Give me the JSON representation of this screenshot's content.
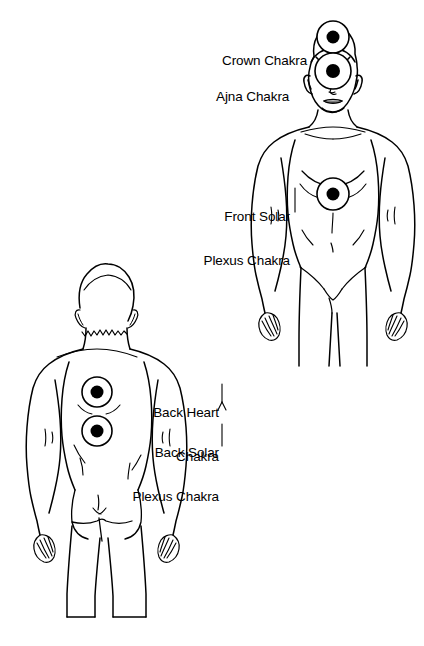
{
  "diagram": {
    "stroke_color": "#000000",
    "fill_color": "#ffffff",
    "chakra_dot_color": "#000000",
    "background_color": "#ffffff"
  },
  "labels": {
    "crown": {
      "lines": [
        "Crown Chakra"
      ],
      "text": "Crown Chakra"
    },
    "ajna": {
      "lines": [
        "Ajna Chakra"
      ],
      "text": "Ajna Chakra"
    },
    "front_solar_plexus": {
      "lines": [
        "Front Solar",
        "Plexus Chakra"
      ],
      "line1": "Front Solar",
      "line2": "Plexus Chakra"
    },
    "back_heart": {
      "lines": [
        "Back Heart",
        "Chakra"
      ],
      "line1": "Back Heart",
      "line2": "Chakra"
    },
    "back_solar_plexus": {
      "lines": [
        "Back Solar",
        "Plexus Chakra"
      ],
      "line1": "Back Solar",
      "line2": "Plexus Chakra"
    }
  },
  "figures": {
    "front": {
      "name": "front-view-body",
      "view": "front"
    },
    "back": {
      "name": "back-view-body",
      "view": "back"
    }
  },
  "chakra_markers": [
    {
      "id": "crown",
      "label": "Crown Chakra",
      "view": "front",
      "cx": 333,
      "cy": 37,
      "outer_r": 16,
      "inner_r": 6.5
    },
    {
      "id": "ajna",
      "label": "Ajna Chakra",
      "view": "front",
      "cx": 333,
      "cy": 71,
      "outer_r": 18,
      "inner_r": 7
    },
    {
      "id": "front_solar_plexus",
      "label": "Front Solar Plexus Chakra",
      "view": "front",
      "cx": 333,
      "cy": 194,
      "outer_r": 16,
      "inner_r": 6.5
    },
    {
      "id": "back_heart",
      "label": "Back Heart Chakra",
      "view": "back",
      "cx": 97,
      "cy": 392,
      "outer_r": 15,
      "inner_r": 6.5
    },
    {
      "id": "back_solar_plexus",
      "label": "Back Solar Plexus Chakra",
      "view": "back",
      "cx": 97,
      "cy": 431,
      "outer_r": 15,
      "inner_r": 6.5
    }
  ]
}
